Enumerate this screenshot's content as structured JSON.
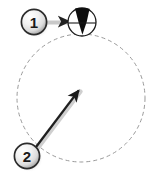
{
  "figure": {
    "width": 159,
    "height": 182,
    "background_color": "#ffffff"
  },
  "colors": {
    "stroke_dark": "#1a1a1a",
    "dashed_path": "#9a9a9a",
    "cone_fill": "#0d0d0d",
    "badge_fill_light": "#fdfdfd",
    "badge_fill_mid": "#d8d8d8",
    "badge_fill_dark": "#8f8f8f",
    "badge_outline": "#2b2b2b",
    "shadow": "#b5b5b5",
    "arrow_fill": "#2b2b2b"
  },
  "callouts": [
    {
      "id": "callout-1",
      "label": "1",
      "cx": 34,
      "cy": 22,
      "r": 13,
      "leader": {
        "from_x": 47,
        "from_y": 22,
        "to_x": 71,
        "to_y": 22,
        "style": "solid-arrow"
      }
    },
    {
      "id": "callout-2",
      "label": "2",
      "cx": 27,
      "cy": 156,
      "r": 13,
      "leader": {
        "from_x": 36,
        "from_y": 147,
        "to_x": 79,
        "to_y": 90,
        "style": "solid-arrow"
      }
    }
  ],
  "orbit_path": {
    "name": "dashed-orbit-circle",
    "cx": 81,
    "cy": 98,
    "r": 64,
    "dash": "4 3",
    "stroke_width": 1
  },
  "target_node": {
    "name": "cone-marker-circle",
    "cx": 82,
    "cy": 22,
    "r": 14,
    "stroke_width": 1.3,
    "cone": {
      "name": "black-cone-wedge",
      "apex_x": 82,
      "apex_y": 35,
      "top_left_x": 75,
      "top_left_y": 9,
      "top_right_x": 90,
      "top_right_y": 9
    },
    "cross_line": {
      "x1": 68,
      "y1": 23,
      "x2": 96,
      "y2": 23
    }
  }
}
